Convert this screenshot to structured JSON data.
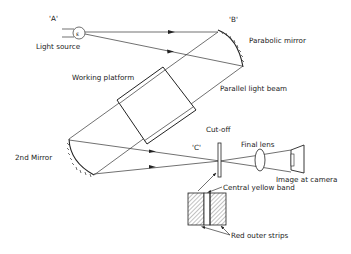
{
  "labels": {
    "point_a": "'A'",
    "point_b": "'B'",
    "point_c": "'C'",
    "light_source": "Light source",
    "parabolic_mirror": "Parabolic mirror",
    "working_platform": "Working platform",
    "parallel_light_beam": "Parallel light beam",
    "second_mirror": "2nd Mirror",
    "cut_off": "Cut-off",
    "final_lens": "Final lens",
    "image_at_camera": "Image at camera",
    "central_yellow_band": "Central yellow band",
    "red_outer_strips": "Red outer strips"
  },
  "colors": {
    "line": "#333333",
    "background": "#ffffff"
  }
}
